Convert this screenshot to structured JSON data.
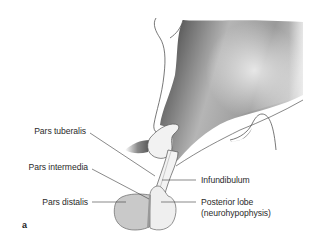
{
  "figure": {
    "panel_letter": "a",
    "labels": {
      "pars_tuberalis": "Pars tuberalis",
      "pars_intermedia": "Pars intermedia",
      "pars_distalis": "Pars distalis",
      "infundibulum": "Infundibulum",
      "posterior_lobe_line1": "Posterior lobe",
      "posterior_lobe_line2": "(neurohypophysis)"
    },
    "colors": {
      "pars_distalis_fill": "#c9c9c9",
      "posterior_lobe_fill": "#efefef",
      "leader_line": "#3a3a3a",
      "shading_dark": "#3c3c3c"
    }
  }
}
